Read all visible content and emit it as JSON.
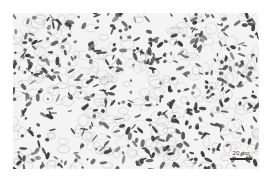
{
  "image": {
    "type": "micrograph",
    "description": "Optical micrograph of equiaxed grain microstructure (light matrix with dark second-phase at grain boundaries)",
    "colors": {
      "background": "#ffffff",
      "matrix": "#f4f4f4",
      "grain_boundary": "#9a9a9a",
      "second_phase": "#3c3c3c"
    },
    "scale_bar": {
      "label": "20 µm"
    },
    "render": {
      "seed": 1337,
      "phase_blob_count": 520,
      "boundary_cell_count": 260
    }
  }
}
